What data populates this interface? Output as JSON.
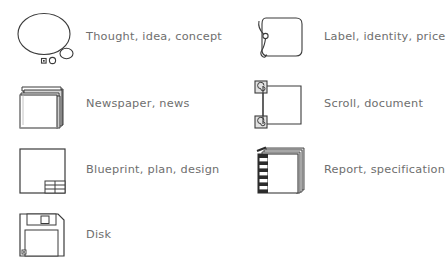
{
  "legend": {
    "title": "Icon legend",
    "text_color": "#6e6e6e",
    "outline_color": "#3b3b3b",
    "shade_color": "#a8a8a8",
    "background_color": "#ffffff",
    "entries": [
      {
        "icon": "thought-bubble-icon",
        "label": "Thought, idea, concept",
        "column": "left",
        "row": 1
      },
      {
        "icon": "tag-label-icon",
        "label": "Label, identity, price",
        "column": "right",
        "row": 1
      },
      {
        "icon": "newspaper-stack-icon",
        "label": "Newspaper, news",
        "column": "left",
        "row": 2
      },
      {
        "icon": "scroll-icon",
        "label": "Scroll, document",
        "column": "right",
        "row": 2
      },
      {
        "icon": "blueprint-icon",
        "label": "Blueprint, plan, design",
        "column": "left",
        "row": 3
      },
      {
        "icon": "spiral-notebook-icon",
        "label": "Report, specification",
        "column": "right",
        "row": 3
      },
      {
        "icon": "floppy-disk-icon",
        "label": "Disk",
        "column": "left",
        "row": 4
      }
    ]
  }
}
